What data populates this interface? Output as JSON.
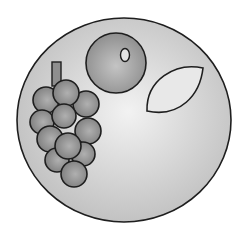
{
  "scene": {
    "title": "Plate of fruit",
    "background": "#ffffff",
    "stroke_color": "#1e1e1e",
    "plate": {
      "label": "plate",
      "cx": 124,
      "cy": 120,
      "rx": 107,
      "ry": 102,
      "highlight_color": "#f2f2f2",
      "edge_color": "#bdbdbd"
    },
    "grapes": {
      "label": "bunch of grapes",
      "fill_light": "#b0b0b0",
      "fill_dark": "#7c7c7c",
      "stem": {
        "x": 52,
        "y": 62,
        "width": 9,
        "height": 24,
        "fill": "#8e8e8e"
      },
      "berries": [
        {
          "cx": 46,
          "cy": 100,
          "r": 13
        },
        {
          "cx": 86,
          "cy": 104,
          "r": 13
        },
        {
          "cx": 66,
          "cy": 93,
          "r": 13
        },
        {
          "cx": 42,
          "cy": 122,
          "r": 12
        },
        {
          "cx": 64,
          "cy": 116,
          "r": 12
        },
        {
          "cx": 88,
          "cy": 131,
          "r": 13
        },
        {
          "cx": 50,
          "cy": 139,
          "r": 13
        },
        {
          "cx": 83,
          "cy": 154,
          "r": 12
        },
        {
          "cx": 57,
          "cy": 160,
          "r": 12
        },
        {
          "cx": 68,
          "cy": 146,
          "r": 13
        },
        {
          "cx": 74,
          "cy": 174,
          "r": 13
        }
      ]
    },
    "orange": {
      "label": "round fruit",
      "cx": 116,
      "cy": 63,
      "r": 30,
      "fill_light": "#c4c4c4",
      "fill_dark": "#8a8a8a",
      "highlight": {
        "cx": 125,
        "cy": 55,
        "rx": 4.5,
        "ry": 6.5,
        "fill": "#e6e6e6"
      }
    },
    "lemon": {
      "label": "lemon",
      "path": "M147,111 C146,80 175,62 203,68 C200,95 180,118 147,111 Z",
      "fill": "#e8e8e8"
    }
  }
}
